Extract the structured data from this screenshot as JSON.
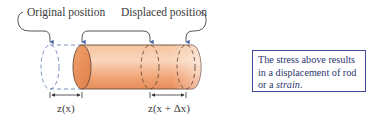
{
  "diagram": {
    "labels": {
      "original": "Original position",
      "displaced": "Displaced position"
    },
    "dimensions": {
      "left": "z(x)",
      "right": "z(x + Δx)"
    },
    "note": {
      "line1": "The stress above results",
      "line2": "in a displacement of rod",
      "line3_prefix": "or a ",
      "line3_emph": "strain",
      "line3_suffix": "."
    },
    "colors": {
      "rod_light": "#f9d9bf",
      "rod_mid": "#f2a677",
      "rod_dark": "#e58a55",
      "outline": "#6a4a3a",
      "dashed_blue": "#6b86b8",
      "arrow_blue": "#4d6aa8",
      "bracket": "#333333",
      "note_border": "#3d4a9e"
    }
  }
}
